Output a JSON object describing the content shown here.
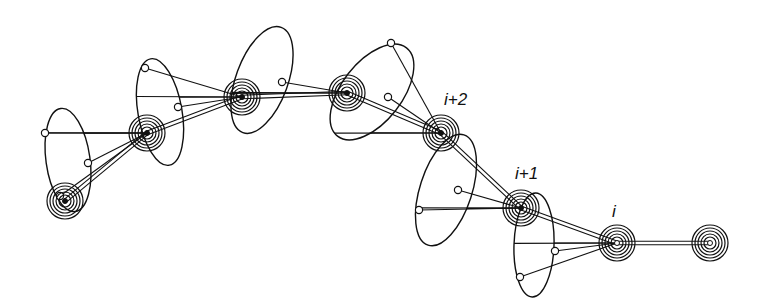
{
  "diagram": {
    "type": "chain-of-cones",
    "stroke": "#111111",
    "background": "#ffffff",
    "nodes": [
      {
        "id": "n0",
        "x": 65,
        "y": 201
      },
      {
        "id": "n1",
        "x": 147,
        "y": 133
      },
      {
        "id": "n2",
        "x": 242,
        "y": 97
      },
      {
        "id": "n3",
        "x": 347,
        "y": 93
      },
      {
        "id": "n4",
        "x": 441,
        "y": 133,
        "label": "i+2"
      },
      {
        "id": "n5",
        "x": 521,
        "y": 208,
        "label": "i+1"
      },
      {
        "id": "n6",
        "x": 617,
        "y": 243,
        "label": "i"
      },
      {
        "id": "n7",
        "x": 710,
        "y": 243
      }
    ],
    "cones": [
      {
        "apex": 1,
        "cx": 68,
        "cy": 160,
        "rx": 22,
        "ry": 52,
        "rot": -8,
        "dots": [
          [
            45,
            133
          ],
          [
            88,
            163
          ],
          [
            60,
            196
          ]
        ]
      },
      {
        "apex": 2,
        "cx": 160,
        "cy": 112,
        "rx": 22,
        "ry": 54,
        "rot": -10,
        "dots": [
          [
            145,
            68
          ],
          [
            178,
            107
          ]
        ]
      },
      {
        "apex": 3,
        "cx": 262,
        "cy": 80,
        "rx": 26,
        "ry": 56,
        "rot": 20,
        "dots": [
          [
            282,
            82
          ]
        ]
      },
      {
        "apex": 4,
        "cx": 372,
        "cy": 92,
        "rx": 30,
        "ry": 56,
        "rot": 38,
        "dots": [
          [
            391,
            43
          ],
          [
            388,
            97
          ]
        ]
      },
      {
        "apex": 5,
        "cx": 446,
        "cy": 190,
        "rx": 26,
        "ry": 58,
        "rot": 18,
        "dots": [
          [
            419,
            210
          ],
          [
            458,
            190
          ]
        ]
      },
      {
        "apex": 6,
        "cx": 534,
        "cy": 245,
        "rx": 20,
        "ry": 52,
        "rot": 2,
        "dots": [
          [
            520,
            277
          ],
          [
            555,
            251
          ]
        ]
      }
    ],
    "labels": [
      {
        "text": "i+2",
        "x": 444,
        "y": 90
      },
      {
        "text": "i+1",
        "x": 515,
        "y": 164
      },
      {
        "text": "i",
        "x": 612,
        "y": 202
      }
    ]
  }
}
